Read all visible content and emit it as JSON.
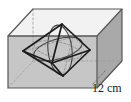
{
  "figure": {
    "dimension_label": "12 cm",
    "shape_outer": "cube",
    "shape_inner": "octahedron",
    "colors": {
      "front_face_fill": "#c9c9c9",
      "right_face_fill": "#a8a8a8",
      "left_face_fill": "#bdbdbd",
      "top_face_fill": "#f2f2f2",
      "edge_visible": "#4d4d4d",
      "edge_hidden": "#9a9a9a",
      "octahedron_edge": "#1a1a1a",
      "sphere_arc": "#3a3a3a",
      "label_color": "#1a1a1a",
      "background": "#ffffff"
    },
    "geometry": {
      "front_face": {
        "top_left": [
          8,
          36
        ],
        "top_right": [
          97,
          36
        ],
        "bottom_right": [
          97,
          88
        ],
        "bottom_left": [
          8,
          88
        ]
      },
      "back_face": {
        "top_left": [
          33,
          9
        ],
        "top_right": [
          122,
          9
        ],
        "bottom_right": [
          122,
          61
        ],
        "bottom_left": [
          33,
          61
        ]
      },
      "octahedron_vertices": {
        "top": [
          62,
          24
        ],
        "bottom": [
          63,
          76
        ],
        "left": [
          23,
          51
        ],
        "right": [
          90,
          50
        ],
        "front": [
          52,
          63
        ],
        "back": [
          73,
          37
        ]
      },
      "sphere_arcs": 3
    }
  }
}
